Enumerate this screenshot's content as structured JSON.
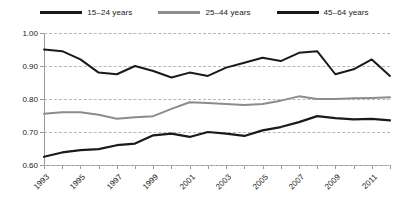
{
  "chart_data": {
    "type": "line",
    "title": "",
    "subtitle": "",
    "xlabel": "",
    "ylabel": "",
    "x": [
      1993,
      1994,
      1995,
      1996,
      1997,
      1998,
      1999,
      2000,
      2001,
      2002,
      2003,
      2004,
      2005,
      2006,
      2007,
      2008,
      2009,
      2010,
      2011,
      2012
    ],
    "xlim": [
      1993,
      2012
    ],
    "ylim": [
      0.6,
      1.0
    ],
    "yticks": [
      0.6,
      0.7,
      0.8,
      0.9,
      1.0
    ],
    "ytick_labels": [
      "0.60",
      "0.70",
      "0.80",
      "0.90",
      "1.00"
    ],
    "xtick_values": [
      1993,
      1995,
      1997,
      1999,
      2001,
      2003,
      2005,
      2007,
      2009,
      2011
    ],
    "xtick_labels": [
      "1993",
      "1995",
      "1997",
      "1999",
      "2001",
      "2003",
      "2005",
      "2007",
      "2009",
      "2011"
    ],
    "grid": "horizontal-dashed",
    "legend_position": "top-center",
    "series": [
      {
        "name": "15–24 years",
        "color": "#1a1a1a",
        "width": 2.0,
        "values": [
          0.95,
          0.945,
          0.92,
          0.88,
          0.875,
          0.9,
          0.885,
          0.865,
          0.88,
          0.87,
          0.895,
          0.91,
          0.925,
          0.915,
          0.94,
          0.945,
          0.875,
          0.89,
          0.92,
          0.87
        ]
      },
      {
        "name": "25–44 years",
        "color": "#8c8c8c",
        "width": 2.0,
        "values": [
          0.755,
          0.76,
          0.76,
          0.752,
          0.74,
          0.745,
          0.748,
          0.77,
          0.79,
          0.788,
          0.785,
          0.782,
          0.785,
          0.795,
          0.808,
          0.8,
          0.8,
          0.802,
          0.803,
          0.805
        ]
      },
      {
        "name": "45–64 years",
        "color": "#1a1a1a",
        "width": 2.2,
        "values": [
          0.625,
          0.638,
          0.645,
          0.648,
          0.66,
          0.665,
          0.69,
          0.695,
          0.685,
          0.7,
          0.695,
          0.688,
          0.705,
          0.715,
          0.73,
          0.748,
          0.742,
          0.738,
          0.74,
          0.735
        ]
      }
    ]
  },
  "legend": {
    "items": [
      {
        "label": "15–24 years",
        "color": "#1a1a1a",
        "thickness": "3px"
      },
      {
        "label": "25–44 years",
        "color": "#8c8c8c",
        "thickness": "3px"
      },
      {
        "label": "45–64 years",
        "color": "#1a1a1a",
        "thickness": "3px"
      }
    ]
  },
  "colors": {
    "axis": "#9a9a9a",
    "grid": "#b8b8b8",
    "text": "#1a1a1a",
    "background": "#ffffff"
  }
}
